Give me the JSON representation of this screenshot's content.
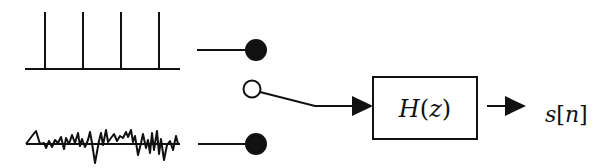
{
  "diagram": {
    "type": "source-filter speech production model",
    "sources": [
      {
        "id": "impulse-train",
        "description": "periodic impulse train (voiced excitation)",
        "impulse_count": 4
      },
      {
        "id": "noise",
        "description": "random noise (unvoiced excitation)"
      }
    ],
    "switch": {
      "description": "voiced/unvoiced selector switch",
      "positions": 2
    },
    "filter": {
      "label_main": "H",
      "label_arg": "z",
      "label": "H(z)"
    },
    "output": {
      "label_var": "s",
      "label_idx": "n",
      "label": "s[n]"
    },
    "colors": {
      "stroke": "#111111",
      "background": "#ffffff"
    }
  }
}
